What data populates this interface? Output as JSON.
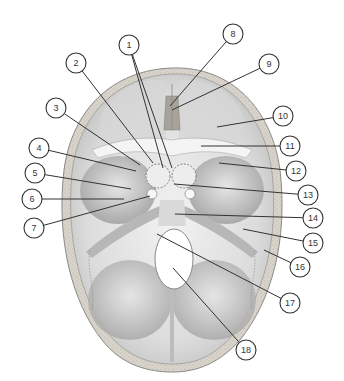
{
  "diagram": {
    "callouts": [
      {
        "label": "1",
        "cx": 129,
        "cy": 45,
        "targets": [
          [
            163,
            168
          ],
          [
            172,
            168
          ]
        ]
      },
      {
        "label": "2",
        "cx": 76,
        "cy": 63,
        "targets": [
          [
            153,
            163
          ]
        ]
      },
      {
        "label": "3",
        "cx": 56,
        "cy": 108,
        "targets": [
          [
            140,
            165
          ]
        ]
      },
      {
        "label": "4",
        "cx": 39,
        "cy": 148,
        "targets": [
          [
            136,
            171
          ]
        ]
      },
      {
        "label": "5",
        "cx": 35,
        "cy": 173,
        "targets": [
          [
            131,
            189
          ]
        ]
      },
      {
        "label": "6",
        "cx": 32,
        "cy": 199,
        "targets": [
          [
            124,
            199
          ]
        ]
      },
      {
        "label": "7",
        "cx": 34,
        "cy": 228,
        "targets": [
          [
            150,
            196
          ]
        ]
      },
      {
        "label": "8",
        "cx": 233,
        "cy": 34,
        "targets": [
          [
            170,
            106
          ]
        ]
      },
      {
        "label": "9",
        "cx": 269,
        "cy": 64,
        "targets": [
          [
            172,
            110
          ]
        ]
      },
      {
        "label": "10",
        "cx": 283,
        "cy": 116,
        "targets": [
          [
            217,
            127
          ]
        ]
      },
      {
        "label": "11",
        "cx": 290,
        "cy": 146,
        "targets": [
          [
            201,
            146
          ]
        ]
      },
      {
        "label": "12",
        "cx": 296,
        "cy": 171,
        "targets": [
          [
            219,
            163
          ]
        ]
      },
      {
        "label": "13",
        "cx": 308,
        "cy": 195,
        "targets": [
          [
            174,
            184
          ]
        ]
      },
      {
        "label": "14",
        "cx": 313,
        "cy": 218,
        "targets": [
          [
            175,
            214
          ]
        ]
      },
      {
        "label": "15",
        "cx": 313,
        "cy": 243,
        "targets": [
          [
            243,
            229
          ]
        ]
      },
      {
        "label": "16",
        "cx": 300,
        "cy": 267,
        "targets": [
          [
            264,
            250
          ]
        ]
      },
      {
        "label": "17",
        "cx": 290,
        "cy": 303,
        "targets": [
          [
            157,
            234
          ]
        ]
      },
      {
        "label": "18",
        "cx": 246,
        "cy": 350,
        "targets": [
          [
            173,
            268
          ]
        ]
      }
    ],
    "colors": {
      "background": "#ffffff",
      "bone_light": "#ececec",
      "bone_mid": "#cfcfcf",
      "bone_dark": "#9c9c9c",
      "outline": "#333333"
    }
  }
}
